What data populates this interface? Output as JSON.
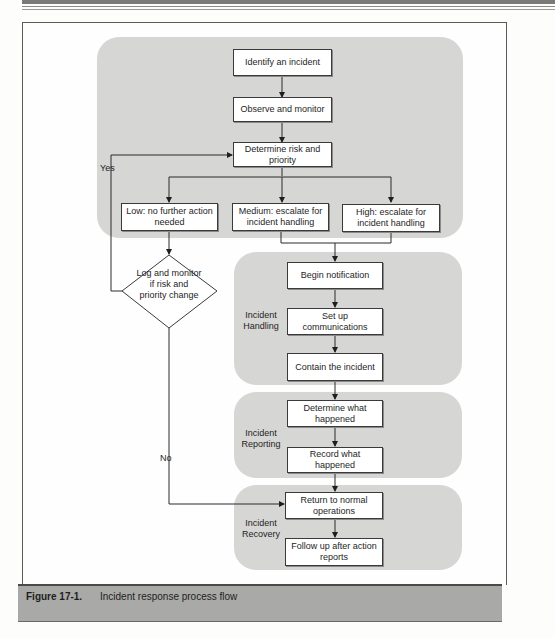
{
  "figure": {
    "number": "Figure 17-1.",
    "caption": "Incident response process flow"
  },
  "flow": {
    "triage": {
      "identify": "Identify an incident",
      "observe": "Observe and monitor",
      "determine": "Determine risk and priority",
      "low": "Low: no further action needed",
      "medium": "Medium: escalate for incident handling",
      "high": "High: escalate for incident handling",
      "decision": "Log and monitor if risk and priority change",
      "yes_label": "Yes",
      "no_label": "No"
    },
    "handling": {
      "label": "Incident Handling",
      "steps": [
        "Begin notification",
        "Set up communications",
        "Contain the incident"
      ]
    },
    "reporting": {
      "label": "Incident Reporting",
      "steps": [
        "Determine what happened",
        "Record what happened"
      ]
    },
    "recovery": {
      "label": "Incident Recovery",
      "steps": [
        "Return to normal operations",
        "Follow up after action reports"
      ]
    }
  },
  "colors": {
    "region_fill": "#d6d6d4",
    "caption_fill": "#a9a9a7",
    "box_border": "#3a3a3a"
  }
}
